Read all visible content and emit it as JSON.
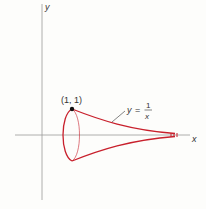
{
  "figure": {
    "axes": {
      "x_label": "x",
      "y_label": "y"
    },
    "point_label": "(1, 1)",
    "curve_label": {
      "lhs": "y",
      "equals": "=",
      "numerator": "1",
      "denominator": "x"
    },
    "colors": {
      "curve": "#c8202c",
      "axis": "#888888",
      "text": "#333333",
      "background": "#fdfdfb"
    }
  }
}
